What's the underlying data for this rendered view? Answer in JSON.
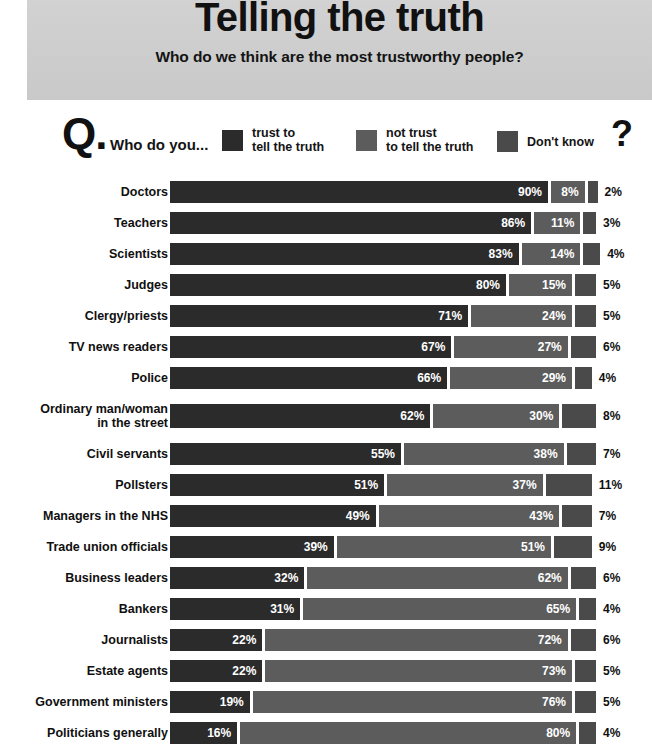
{
  "header": {
    "title": "Telling the truth",
    "subtitle": "Who do we think are the most trustworthy people?"
  },
  "legend": {
    "q_mark": "Q.",
    "question": "Who do you...",
    "end_mark": "?",
    "items": [
      {
        "label_line1": "trust to",
        "label_line2": "tell the truth",
        "color": "#2b2b2b",
        "key": "trust"
      },
      {
        "label_line1": "not trust",
        "label_line2": "to tell the truth",
        "color": "#5c5c5c",
        "key": "not_trust"
      },
      {
        "label_line1": "Don't know",
        "label_line2": "",
        "color": "#4a4a4a",
        "key": "dont_know"
      }
    ]
  },
  "chart_data": {
    "type": "bar",
    "subtype": "stacked-horizontal",
    "title": "Telling the truth",
    "subtitle": "Who do we think are the most trustworthy people?",
    "question": "Who do you...",
    "xlabel": "",
    "ylabel": "",
    "xlim": [
      0,
      100
    ],
    "unit": "%",
    "grid": false,
    "legend_position": "top",
    "series": [
      {
        "name": "trust to tell the truth",
        "color": "#2b2b2b",
        "values": [
          90,
          86,
          83,
          80,
          71,
          67,
          66,
          62,
          55,
          51,
          49,
          39,
          32,
          31,
          22,
          22,
          19,
          16
        ]
      },
      {
        "name": "not trust to tell the truth",
        "color": "#5c5c5c",
        "values": [
          8,
          11,
          14,
          15,
          24,
          27,
          29,
          30,
          38,
          37,
          43,
          51,
          62,
          65,
          72,
          73,
          76,
          80
        ]
      },
      {
        "name": "Don't know",
        "color": "#4a4a4a",
        "values": [
          2,
          3,
          4,
          5,
          5,
          6,
          4,
          8,
          7,
          11,
          7,
          9,
          6,
          4,
          6,
          5,
          5,
          4
        ]
      }
    ],
    "categories": [
      "Doctors",
      "Teachers",
      "Scientists",
      "Judges",
      "Clergy/priests",
      "TV news readers",
      "Police",
      "Ordinary man/woman\nin the street",
      "Civil servants",
      "Pollsters",
      "Managers in the NHS",
      "Trade union officials",
      "Business leaders",
      "Bankers",
      "Journalists",
      "Estate agents",
      "Government ministers",
      "Politicians generally"
    ]
  },
  "rows": [
    {
      "label": "Doctors",
      "trust": 90,
      "not_trust": 8,
      "dont_know": 2,
      "trust_text": "90%",
      "not_trust_text": "8%",
      "dont_know_text": "2%",
      "tall": false
    },
    {
      "label": "Teachers",
      "trust": 86,
      "not_trust": 11,
      "dont_know": 3,
      "trust_text": "86%",
      "not_trust_text": "11%",
      "dont_know_text": "3%",
      "tall": false
    },
    {
      "label": "Scientists",
      "trust": 83,
      "not_trust": 14,
      "dont_know": 4,
      "trust_text": "83%",
      "not_trust_text": "14%",
      "dont_know_text": "4%",
      "tall": false
    },
    {
      "label": "Judges",
      "trust": 80,
      "not_trust": 15,
      "dont_know": 5,
      "trust_text": "80%",
      "not_trust_text": "15%",
      "dont_know_text": "5%",
      "tall": false
    },
    {
      "label": "Clergy/priests",
      "trust": 71,
      "not_trust": 24,
      "dont_know": 5,
      "trust_text": "71%",
      "not_trust_text": "24%",
      "dont_know_text": "5%",
      "tall": false
    },
    {
      "label": "TV news readers",
      "trust": 67,
      "not_trust": 27,
      "dont_know": 6,
      "trust_text": "67%",
      "not_trust_text": "27%",
      "dont_know_text": "6%",
      "tall": false
    },
    {
      "label": "Police",
      "trust": 66,
      "not_trust": 29,
      "dont_know": 4,
      "trust_text": "66%",
      "not_trust_text": "29%",
      "dont_know_text": "4%",
      "tall": false
    },
    {
      "label": "Ordinary man/woman\nin the street",
      "trust": 62,
      "not_trust": 30,
      "dont_know": 8,
      "trust_text": "62%",
      "not_trust_text": "30%",
      "dont_know_text": "8%",
      "tall": true
    },
    {
      "label": "Civil servants",
      "trust": 55,
      "not_trust": 38,
      "dont_know": 7,
      "trust_text": "55%",
      "not_trust_text": "38%",
      "dont_know_text": "7%",
      "tall": false
    },
    {
      "label": "Pollsters",
      "trust": 51,
      "not_trust": 37,
      "dont_know": 11,
      "trust_text": "51%",
      "not_trust_text": "37%",
      "dont_know_text": "11%",
      "tall": false
    },
    {
      "label": "Managers in the NHS",
      "trust": 49,
      "not_trust": 43,
      "dont_know": 7,
      "trust_text": "49%",
      "not_trust_text": "43%",
      "dont_know_text": "7%",
      "tall": false
    },
    {
      "label": "Trade union officials",
      "trust": 39,
      "not_trust": 51,
      "dont_know": 9,
      "trust_text": "39%",
      "not_trust_text": "51%",
      "dont_know_text": "9%",
      "tall": false
    },
    {
      "label": "Business leaders",
      "trust": 32,
      "not_trust": 62,
      "dont_know": 6,
      "trust_text": "32%",
      "not_trust_text": "62%",
      "dont_know_text": "6%",
      "tall": false
    },
    {
      "label": "Bankers",
      "trust": 31,
      "not_trust": 65,
      "dont_know": 4,
      "trust_text": "31%",
      "not_trust_text": "65%",
      "dont_know_text": "4%",
      "tall": false
    },
    {
      "label": "Journalists",
      "trust": 22,
      "not_trust": 72,
      "dont_know": 6,
      "trust_text": "22%",
      "not_trust_text": "72%",
      "dont_know_text": "6%",
      "tall": false
    },
    {
      "label": "Estate agents",
      "trust": 22,
      "not_trust": 73,
      "dont_know": 5,
      "trust_text": "22%",
      "not_trust_text": "73%",
      "dont_know_text": "5%",
      "tall": false
    },
    {
      "label": "Government ministers",
      "trust": 19,
      "not_trust": 76,
      "dont_know": 5,
      "trust_text": "19%",
      "not_trust_text": "76%",
      "dont_know_text": "5%",
      "tall": false
    },
    {
      "label": "Politicians generally",
      "trust": 16,
      "not_trust": 80,
      "dont_know": 4,
      "trust_text": "16%",
      "not_trust_text": "80%",
      "dont_know_text": "4%",
      "tall": false
    }
  ]
}
